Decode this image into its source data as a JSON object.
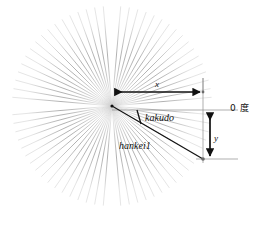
{
  "figure": {
    "background_color": "#ffffff",
    "width": 257,
    "height": 226
  },
  "labels": {
    "x": "x",
    "y": "y",
    "kakudo": "kakudo",
    "hankei": "hankei1",
    "zero_degree": "0 度"
  },
  "colors": {
    "ray_stroke": "#9a9a9a",
    "annotation_stroke": "#111111",
    "guide_stroke": "#808080",
    "text": "#111111"
  },
  "chart_data": {
    "type": "scatter",
    "xlabel": "x",
    "ylabel": "y",
    "grid": false,
    "legend": null,
    "annotations": [
      {
        "name": "x-dimension",
        "label": "x",
        "kind": "double-arrow",
        "orientation": "horizontal"
      },
      {
        "name": "y-dimension",
        "label": "y",
        "kind": "double-arrow",
        "orientation": "vertical"
      },
      {
        "name": "angle-marker",
        "label": "kakudo",
        "kind": "angle-arc"
      },
      {
        "name": "radius-line",
        "label": "hankei1",
        "kind": "line-segment"
      },
      {
        "name": "zero-degree-axis",
        "label": "0 度",
        "kind": "reference-axis"
      }
    ],
    "center": {
      "x": 112,
      "y": 106
    },
    "radius_px": 100,
    "ray_count": 72,
    "radius_endpoint": {
      "x": 203,
      "y": 159
    },
    "x_extent": {
      "from": 112,
      "to": 203
    },
    "y_extent": {
      "from": 110,
      "to": 159
    }
  }
}
